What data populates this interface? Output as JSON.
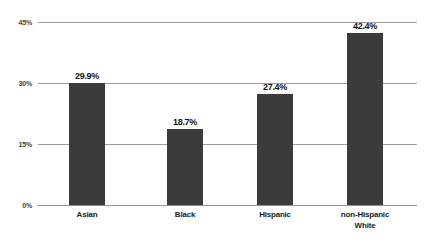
{
  "chart_data": {
    "type": "bar",
    "title": "",
    "subtitle": "",
    "xlabel": "",
    "ylabel": "",
    "categories": [
      "Asian",
      "Black",
      "Hispanic",
      "non-Hispanic White"
    ],
    "category_lines": [
      [
        "Asian"
      ],
      [
        "Black"
      ],
      [
        "Hispanic"
      ],
      [
        "non-Hispanic",
        "White"
      ]
    ],
    "values": [
      29.9,
      18.7,
      27.4,
      42.4
    ],
    "value_labels": [
      "29.9%",
      "18.7%",
      "27.4%",
      "42.4%"
    ],
    "ylim": [
      0,
      45
    ],
    "yticks": [
      0,
      15,
      30,
      45
    ],
    "ytick_labels": [
      "0%",
      "15%",
      "30%",
      "45%"
    ],
    "grid": true,
    "grid_axis": "y",
    "legend": false,
    "legend_position": "none",
    "bar_color": "#3b3b3b",
    "gridline_color": "#8c8c8c",
    "text_color": "#1a1a1a",
    "background_color": "#ffffff"
  }
}
